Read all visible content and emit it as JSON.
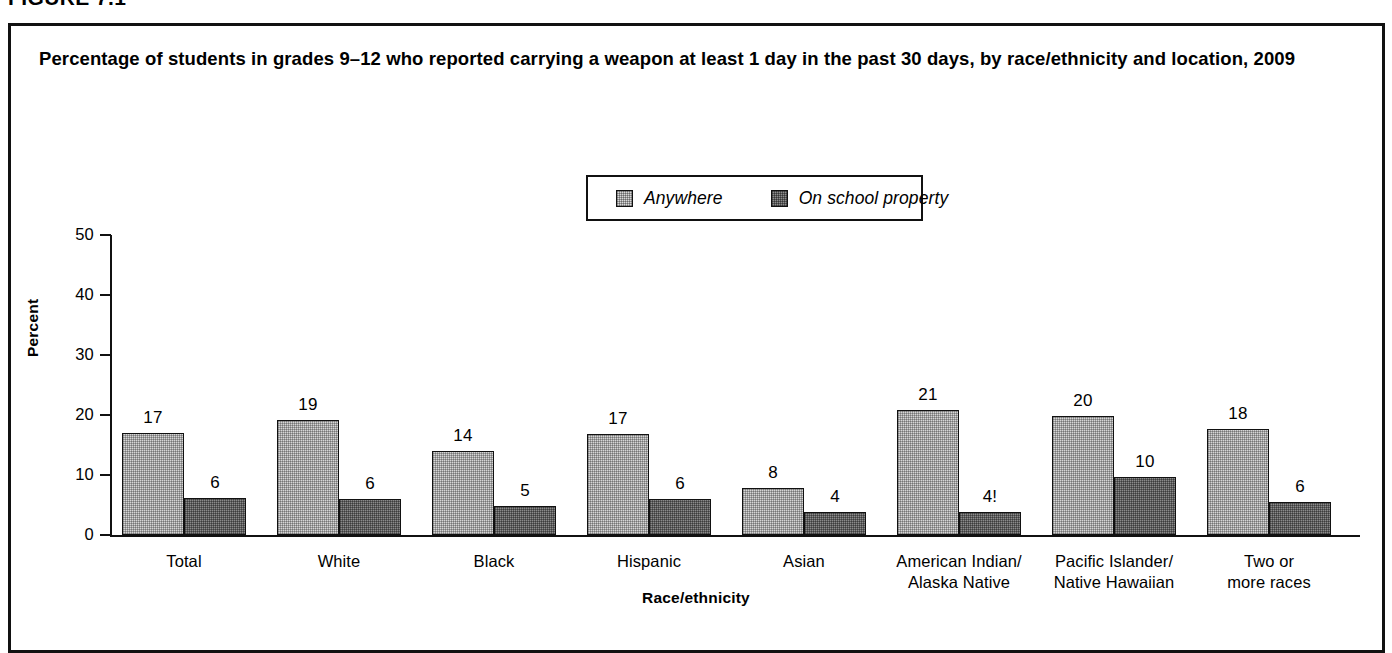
{
  "figure": {
    "label": "FIGURE 7.1"
  },
  "title": "Percentage of students in grades 9–12 who reported carrying a weapon at least 1 day in the past 30 days, by race/ethnicity and location, 2009",
  "legend": {
    "position": "top-center",
    "entries": [
      {
        "label": "Anywhere",
        "swatch": "light-gray-stipple",
        "color": "#d6d6d6"
      },
      {
        "label": "On school property",
        "swatch": "dark-gray-stipple",
        "color": "#8b8b8b"
      }
    ]
  },
  "chart_data": {
    "type": "bar",
    "title": "Percentage of students in grades 9–12 who reported carrying a weapon at least 1 day in the past 30 days, by race/ethnicity and location, 2009",
    "xlabel": "Race/ethnicity",
    "ylabel": "Percent",
    "ylim": [
      0,
      50
    ],
    "yticks": [
      0,
      10,
      20,
      30,
      40,
      50
    ],
    "ytick_labels": [
      "0",
      "10",
      "20",
      "30",
      "40",
      "50"
    ],
    "grid": false,
    "legend_position": "top-center",
    "categories": [
      "Total",
      "White",
      "Black",
      "Hispanic",
      "Asian",
      "American Indian/\nAlaska Native",
      "Pacific Islander/\nNative Hawaiian",
      "Two or\nmore races"
    ],
    "category_lines": [
      [
        "Total"
      ],
      [
        "White"
      ],
      [
        "Black"
      ],
      [
        "Hispanic"
      ],
      [
        "Asian"
      ],
      [
        "American Indian/",
        "Alaska Native"
      ],
      [
        "Pacific Islander/",
        "Native Hawaiian"
      ],
      [
        "Two or",
        "more races"
      ]
    ],
    "series": [
      {
        "name": "Anywhere",
        "color": "#d6d6d6",
        "values": [
          17,
          19,
          14,
          17,
          8,
          21,
          20,
          18
        ],
        "plotted": [
          17.0,
          19.2,
          14.0,
          16.8,
          7.8,
          20.8,
          19.8,
          17.7
        ],
        "data_labels": [
          "17",
          "19",
          "14",
          "17",
          "8",
          "21",
          "20",
          "18"
        ]
      },
      {
        "name": "On school property",
        "color": "#8b8b8b",
        "values": [
          6,
          6,
          5,
          6,
          4,
          4,
          10,
          6
        ],
        "plotted": [
          6.1,
          6.0,
          4.9,
          6.0,
          3.8,
          3.8,
          9.6,
          5.5
        ],
        "data_labels": [
          "6",
          "6",
          "5",
          "6",
          "4",
          "4!",
          "10",
          "6"
        ]
      }
    ]
  }
}
